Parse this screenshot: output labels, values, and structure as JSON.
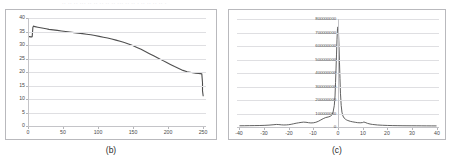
{
  "page": {
    "top_cut_text": "·· ·· ·· ··· ·· ·· ·· ·· ·· ··· ·· ·· · ·· ·· ·· ·· ·",
    "background_color": "#ffffff",
    "frame_color": "#b9b9bd",
    "grid_color": "#dfdfe2",
    "line_color": "#4f4f4f"
  },
  "panels": [
    {
      "caption": "(b)",
      "name": "panel-b"
    },
    {
      "caption": "(c)",
      "name": "panel-c"
    }
  ],
  "chart_data": [
    {
      "type": "line",
      "name": "chart-b",
      "title": "",
      "xlabel": "",
      "ylabel": "",
      "xlim": [
        0,
        255
      ],
      "ylim": [
        0,
        40
      ],
      "xticks": [
        0,
        50,
        100,
        150,
        200,
        250
      ],
      "yticks": [
        0,
        5,
        10,
        15,
        20,
        25,
        30,
        35,
        40
      ],
      "xtick_labels": [
        "0",
        "50",
        "100",
        "150",
        "200",
        "250"
      ],
      "ytick_labels": [
        "0",
        "5",
        "10",
        "15",
        "20",
        "25",
        "30",
        "35",
        "40"
      ],
      "grid": true,
      "legend": "none",
      "series": [
        {
          "name": "curve",
          "color": "#4f4f4f",
          "x": [
            0,
            2,
            4,
            5,
            6,
            7,
            8,
            10,
            14,
            18,
            22,
            26,
            30,
            36,
            42,
            48,
            54,
            60,
            66,
            72,
            78,
            84,
            90,
            96,
            102,
            108,
            114,
            120,
            126,
            132,
            138,
            144,
            150,
            156,
            162,
            168,
            174,
            180,
            186,
            192,
            198,
            204,
            210,
            216,
            222,
            228,
            234,
            240,
            244,
            247,
            249,
            250,
            250,
            251
          ],
          "y": [
            33.2,
            33.1,
            33.0,
            33.0,
            33.1,
            36.6,
            37.0,
            36.8,
            36.6,
            36.4,
            36.2,
            36.0,
            35.8,
            35.6,
            35.4,
            35.2,
            35.0,
            34.8,
            34.6,
            34.4,
            34.2,
            34.0,
            33.8,
            33.5,
            33.2,
            32.9,
            32.6,
            32.2,
            31.8,
            31.4,
            30.9,
            30.4,
            29.8,
            29.1,
            28.4,
            27.6,
            26.8,
            26.0,
            25.2,
            24.4,
            23.6,
            22.8,
            22.0,
            21.3,
            20.6,
            20.1,
            19.8,
            19.6,
            19.5,
            19.4,
            19.3,
            16.0,
            13.0,
            11.0
          ]
        }
      ]
    },
    {
      "type": "line",
      "name": "chart-c",
      "title": "",
      "xlabel": "",
      "ylabel": "",
      "xlim": [
        -41,
        41
      ],
      "ylim": [
        0,
        800000000
      ],
      "xticks": [
        -40,
        -30,
        -20,
        -10,
        0,
        10,
        20,
        30,
        40
      ],
      "yticks": [
        0,
        100000000,
        200000000,
        300000000,
        400000000,
        500000000,
        600000000,
        700000000,
        800000000
      ],
      "xtick_labels": [
        "-40",
        "-30",
        "-20",
        "-10",
        "0",
        "10",
        "20",
        "30",
        "40"
      ],
      "ytick_labels": [
        "0",
        "100000000",
        "200000000",
        "300000000",
        "400000000",
        "500000000",
        "600000000",
        "700000000",
        "800000000"
      ],
      "grid": true,
      "legend": "none",
      "series": [
        {
          "name": "spectrum",
          "color": "#4f4f4f",
          "x": [
            -40,
            -38,
            -36,
            -34,
            -32,
            -30,
            -28,
            -26,
            -25,
            -24,
            -23,
            -22,
            -21,
            -20,
            -19,
            -18,
            -17,
            -16,
            -15,
            -14,
            -13,
            -12,
            -11,
            -10,
            -9,
            -8,
            -7,
            -6,
            -5,
            -4,
            -3,
            -2.5,
            -2,
            -1.5,
            -1.2,
            -1,
            -0.8,
            -0.6,
            -0.4,
            -0.2,
            0,
            0.2,
            0.4,
            0.6,
            0.8,
            1,
            1.3,
            1.6,
            2,
            2.5,
            3,
            3.5,
            4,
            5,
            6,
            7,
            8,
            9,
            10,
            10.5,
            11,
            12,
            13,
            14,
            15,
            16,
            18,
            20,
            22,
            24,
            26,
            28,
            30,
            32,
            34,
            36,
            38,
            40
          ],
          "y": [
            9000000,
            9500000,
            10000000,
            10500000,
            11000000,
            12000000,
            14000000,
            17000000,
            19000000,
            18000000,
            16000000,
            15000000,
            15500000,
            17000000,
            20000000,
            24000000,
            28000000,
            31000000,
            34000000,
            36000000,
            35000000,
            32000000,
            30000000,
            31000000,
            35000000,
            42000000,
            52000000,
            62000000,
            70000000,
            74000000,
            80000000,
            90000000,
            110000000,
            160000000,
            230000000,
            330000000,
            430000000,
            540000000,
            650000000,
            730000000,
            742000000,
            700000000,
            600000000,
            480000000,
            360000000,
            250000000,
            160000000,
            110000000,
            82000000,
            66000000,
            58000000,
            52000000,
            48000000,
            42000000,
            38000000,
            35000000,
            32000000,
            31000000,
            33000000,
            37000000,
            34000000,
            27000000,
            22000000,
            19000000,
            17000000,
            15000000,
            13000000,
            11500000,
            10500000,
            10000000,
            9500000,
            9200000,
            9000000,
            8800000,
            8600000,
            8400000,
            8200000,
            8000000
          ]
        }
      ]
    }
  ]
}
